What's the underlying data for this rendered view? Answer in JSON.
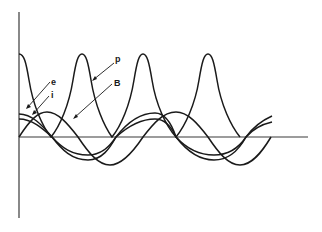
{
  "diagram": {
    "type": "waveform-diagram",
    "axes": {
      "vertical": {
        "x": 19,
        "y_top": 12,
        "y_bottom": 218
      },
      "horizontal": {
        "y": 137,
        "x_start": 19,
        "x_end": 308
      }
    },
    "labels": {
      "p": "p",
      "B": "B",
      "e": "e",
      "i": "i"
    },
    "curves": [
      {
        "name": "p",
        "description": "pulsating waveform with sharp peaks, touching zero at troughs",
        "peak_x": [
          19,
          82,
          143,
          208
        ],
        "trough_x": [
          51,
          112,
          176,
          240
        ]
      },
      {
        "name": "B",
        "description": "sinusoid starting at origin"
      },
      {
        "name": "e",
        "description": "sinusoid leading, starting above axis"
      },
      {
        "name": "i",
        "description": "sinusoid slightly lagging e"
      }
    ],
    "colors": {
      "line": "#1a1a1a",
      "axis": "#3a3a3a",
      "background": "#ffffff"
    }
  }
}
